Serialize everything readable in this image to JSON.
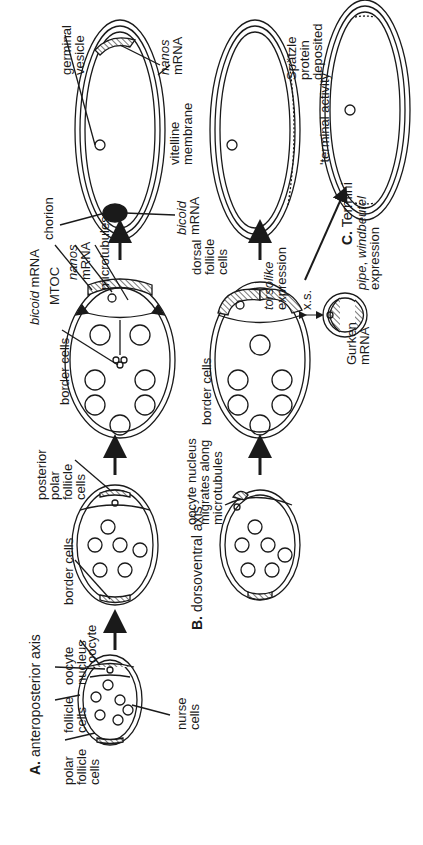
{
  "figure": {
    "orientation": "rotated 90 degrees counter-clockwise",
    "panels": {
      "A": {
        "letter": "A.",
        "title": "anteroposterior axis"
      },
      "B": {
        "letter": "B.",
        "title": "dorsoventral axis"
      },
      "C": {
        "letter": "C.",
        "title": "Termini"
      }
    },
    "labels": {
      "polar_follicle_cells": [
        "polar",
        "follicle",
        "cells"
      ],
      "follicle_cells": [
        "follicle",
        "cells"
      ],
      "oocyte_nucleus": [
        "oocyte",
        "nucleus"
      ],
      "oocyte": "oocyte",
      "nurse_cells": [
        "nurse",
        "cells"
      ],
      "border_cells_1": "border cells",
      "posterior_polar_follicle_cells": [
        "posterior",
        "polar",
        "follicle",
        "cells"
      ],
      "border_cells_2": "border cells",
      "bicoid_mrna_top": {
        "italic": "bicoid",
        "rest": " mRNA"
      },
      "mtoc": "MTOC",
      "nanos_mrna_mid": [
        "nanos",
        "mRNA"
      ],
      "microtubules": "microtubules",
      "chorion": "chorion",
      "bicoid_mrna_right": [
        "bicoid",
        "mRNA"
      ],
      "germinal_vesicle": [
        "germinal",
        "vesicle"
      ],
      "nanos_mrna_right": [
        "nanos",
        "mRNA"
      ],
      "vitelline_membrane": [
        "vitelline",
        "membrane"
      ],
      "oocyte_nucleus_migrates": [
        "oocyte nucleus",
        "migrates along",
        "microtubules"
      ],
      "border_cells_3": "border cells",
      "dorsal_follicle_cells": [
        "dorsal",
        "follicle",
        "cells"
      ],
      "torsolike_expression": [
        "torsolike",
        "expression"
      ],
      "xs": "x.s.",
      "gurken_mrna": [
        "Gurken",
        "mRNA"
      ],
      "pipe_windbeutel_expression": {
        "italic1": "pipe",
        "sep": ", ",
        "italic2": "windbeutel",
        "line2": "expression"
      },
      "spatzle_protein_deposited": [
        "Spätzle",
        "protein",
        "deposited"
      ],
      "terminal_activity": "'terminal activity'"
    },
    "colors": {
      "ink": "#1a1a1a",
      "background": "#ffffff",
      "hatch": "#555555"
    }
  }
}
